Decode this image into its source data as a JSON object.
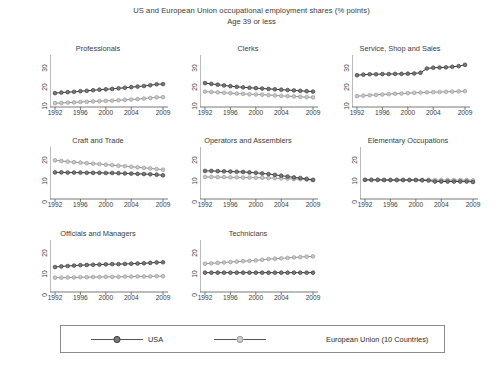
{
  "chart_data": {
    "type": "line",
    "title": "US and European Union occupational employment shares (% points)",
    "subtitle": "Age 39 or less",
    "xlabel": "",
    "ylabel": "",
    "grid": false,
    "legend_position": "bottom",
    "x": [
      1992,
      1993,
      1994,
      1995,
      1996,
      1997,
      1998,
      1999,
      2000,
      2001,
      2002,
      2003,
      2004,
      2005,
      2006,
      2007,
      2008,
      2009
    ],
    "xticks": [
      "1992",
      "1996",
      "2000",
      "2004",
      "2009"
    ],
    "xtick_values": [
      1992,
      1996,
      2000,
      2004,
      2009
    ],
    "series_names": [
      "USA",
      "European Union (10 Countries)"
    ],
    "colors": {
      "usa": "#555555",
      "eu": "#b0b0b0"
    },
    "panels": [
      {
        "title": "Professionals",
        "yticks": [
          "10",
          "20",
          "30"
        ],
        "ytick_values": [
          10,
          20,
          30
        ],
        "ylim": [
          6,
          33
        ],
        "series": [
          {
            "name": "USA",
            "values": [
              13.2,
              13.5,
              13.7,
              13.9,
              14.2,
              14.4,
              14.7,
              15.0,
              15.2,
              15.4,
              15.7,
              16.0,
              16.3,
              16.6,
              16.9,
              17.3,
              17.8,
              17.9
            ]
          },
          {
            "name": "European Union (10 Countries)",
            "values": [
              8.0,
              8.1,
              8.3,
              8.4,
              8.6,
              8.7,
              8.9,
              9.0,
              9.2,
              9.3,
              9.5,
              9.7,
              9.9,
              10.1,
              10.4,
              10.7,
              11.0,
              11.1
            ]
          }
        ]
      },
      {
        "title": "Clerks",
        "yticks": [
          "10",
          "20",
          "30"
        ],
        "ytick_values": [
          10,
          20,
          30
        ],
        "ylim": [
          6,
          33
        ],
        "series": [
          {
            "name": "USA",
            "values": [
              18.4,
              18.0,
              17.6,
              17.2,
              16.8,
              16.5,
              16.2,
              16.0,
              15.8,
              15.6,
              15.4,
              15.2,
              15.0,
              14.8,
              14.6,
              14.4,
              14.2,
              14.0
            ]
          },
          {
            "name": "European Union (10 Countries)",
            "values": [
              14.0,
              13.8,
              13.6,
              13.4,
              13.2,
              13.0,
              12.8,
              12.6,
              12.5,
              12.4,
              12.2,
              12.0,
              11.8,
              11.6,
              11.5,
              11.3,
              11.1,
              11.0
            ]
          }
        ]
      },
      {
        "title": "Service, Shop and Sales",
        "yticks": [
          "10",
          "20",
          "30"
        ],
        "ytick_values": [
          10,
          20,
          30
        ],
        "ylim": [
          6,
          33
        ],
        "series": [
          {
            "name": "USA",
            "values": [
              22.5,
              22.8,
              23.0,
              23.0,
              23.1,
              23.1,
              23.2,
              23.2,
              23.3,
              23.4,
              23.8,
              26.0,
              26.4,
              26.5,
              26.6,
              26.9,
              27.2,
              27.9
            ]
          },
          {
            "name": "European Union (10 Countries)",
            "values": [
              11.6,
              11.9,
              12.1,
              12.3,
              12.5,
              12.7,
              12.9,
              13.0,
              13.2,
              13.4,
              13.5,
              13.6,
              13.7,
              13.8,
              13.9,
              14.0,
              14.1,
              14.2
            ]
          }
        ]
      },
      {
        "title": "Craft and Trade",
        "yticks": [
          "0",
          "10",
          "20"
        ],
        "ytick_values": [
          0,
          10,
          20
        ],
        "ylim": [
          -2,
          23
        ],
        "series": [
          {
            "name": "USA",
            "values": [
              10.8,
              10.8,
              10.7,
              10.7,
              10.7,
              10.6,
              10.6,
              10.6,
              10.5,
              10.5,
              10.4,
              10.3,
              10.2,
              10.1,
              10.0,
              9.9,
              9.7,
              9.4
            ]
          },
          {
            "name": "European Union (10 Countries)",
            "values": [
              16.6,
              16.3,
              16.0,
              15.7,
              15.5,
              15.2,
              15.0,
              14.8,
              14.5,
              14.3,
              14.0,
              13.8,
              13.5,
              13.2,
              13.0,
              12.7,
              12.4,
              12.1
            ]
          }
        ]
      },
      {
        "title": "Operators and Assemblers",
        "yticks": [
          "0",
          "10",
          "20"
        ],
        "ytick_values": [
          0,
          10,
          20
        ],
        "ylim": [
          -2,
          23
        ],
        "series": [
          {
            "name": "USA",
            "values": [
              11.5,
              11.5,
              11.4,
              11.3,
              11.2,
              11.1,
              11.0,
              10.8,
              10.6,
              10.3,
              10.0,
              9.6,
              9.2,
              8.8,
              8.4,
              8.1,
              7.7,
              7.2
            ]
          },
          {
            "name": "European Union (10 Countries)",
            "values": [
              8.6,
              8.6,
              8.5,
              8.5,
              8.4,
              8.4,
              8.3,
              8.3,
              8.2,
              8.2,
              8.1,
              8.0,
              7.9,
              7.8,
              7.6,
              7.5,
              7.3,
              7.1
            ]
          }
        ]
      },
      {
        "title": "Elementary Occupations",
        "yticks": [
          "0",
          "10",
          "20"
        ],
        "ytick_values": [
          0,
          10,
          20
        ],
        "ylim": [
          -2,
          23
        ],
        "series": [
          {
            "name": "USA",
            "values": [
              7.2,
              7.2,
              7.2,
              7.1,
              7.1,
              7.1,
              7.1,
              7.1,
              7.1,
              7.0,
              6.9,
              6.4,
              6.4,
              6.4,
              6.4,
              6.4,
              6.4,
              6.2
            ]
          },
          {
            "name": "European Union (10 Countries)",
            "values": [
              7.2,
              7.2,
              7.2,
              7.2,
              7.2,
              7.2,
              7.2,
              7.2,
              7.2,
              7.2,
              7.2,
              7.1,
              7.1,
              7.1,
              7.1,
              7.1,
              7.1,
              7.0
            ]
          }
        ]
      },
      {
        "title": "Officials and Managers",
        "yticks": [
          "0",
          "10",
          "20"
        ],
        "ytick_values": [
          0,
          10,
          20
        ],
        "ylim": [
          -2,
          23
        ],
        "series": [
          {
            "name": "USA",
            "values": [
              10.0,
              10.3,
              10.5,
              10.7,
              10.9,
              11.0,
              11.1,
              11.2,
              11.3,
              11.4,
              11.4,
              11.5,
              11.6,
              11.7,
              11.8,
              12.0,
              12.2,
              12.3
            ]
          },
          {
            "name": "European Union (10 Countries)",
            "values": [
              4.9,
              4.9,
              5.0,
              5.0,
              5.1,
              5.1,
              5.2,
              5.2,
              5.3,
              5.3,
              5.3,
              5.4,
              5.4,
              5.5,
              5.5,
              5.5,
              5.6,
              5.6
            ]
          }
        ]
      },
      {
        "title": "Technicians",
        "yticks": [
          "0",
          "10",
          "20"
        ],
        "ytick_values": [
          0,
          10,
          20
        ],
        "ylim": [
          -2,
          23
        ],
        "series": [
          {
            "name": "USA",
            "values": [
              7.3,
              7.3,
              7.3,
              7.3,
              7.3,
              7.3,
              7.3,
              7.3,
              7.3,
              7.3,
              7.3,
              7.3,
              7.3,
              7.3,
              7.3,
              7.3,
              7.3,
              7.3
            ]
          },
          {
            "name": "European Union (10 Countries)",
            "values": [
              11.6,
              11.8,
              12.0,
              12.2,
              12.4,
              12.6,
              12.8,
              13.0,
              13.2,
              13.5,
              13.8,
              14.0,
              14.2,
              14.4,
              14.6,
              14.8,
              15.0,
              15.1
            ]
          }
        ]
      }
    ]
  },
  "legend": {
    "usa_label": "USA",
    "eu_label": "European Union (10 Countries)"
  }
}
